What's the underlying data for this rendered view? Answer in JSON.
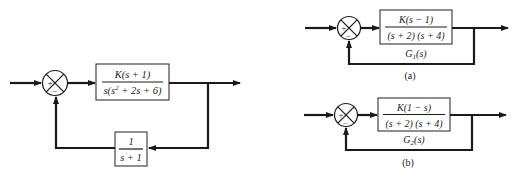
{
  "figure": {
    "left": {
      "sum_signs": {
        "plus": "+",
        "minus": "−"
      },
      "forward_block": {
        "numerator": "K(s + 1)",
        "denominator_pre": "s(s",
        "denominator_sup": "2",
        "denominator_post": " + 2s + 6)"
      },
      "feedback_block": {
        "numerator": "1",
        "denominator": "s + 1"
      }
    },
    "a": {
      "sum_signs": {
        "plus": "+",
        "minus": "−"
      },
      "forward_block": {
        "numerator": "K(s − 1)",
        "denominator": "(s + 2) (s + 4)"
      },
      "transfer_label_main": "G",
      "transfer_label_sub": "1",
      "transfer_label_arg": "(s)",
      "caption": "(a)"
    },
    "b": {
      "sum_signs": {
        "plus": "+",
        "minus": "−"
      },
      "forward_block": {
        "numerator": "K(1 − s)",
        "denominator": "(s + 2) (s + 4)"
      },
      "transfer_label_main": "G",
      "transfer_label_sub": "2",
      "transfer_label_arg": "(s)",
      "caption": "(b)"
    }
  }
}
